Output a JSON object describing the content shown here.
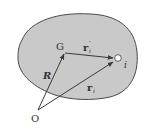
{
  "diagram": {
    "type": "rigid-body-position-vectors",
    "colors": {
      "body_fill": "#c9c9c9",
      "body_stroke": "#4a4a4a",
      "arrow": "#3a3a3a",
      "text": "#333333",
      "particle_fill": "#ffffff"
    },
    "labels": {
      "center_of_mass": "G",
      "origin": "O",
      "particle": "i",
      "R": "R",
      "r_prime_base": "r",
      "r_prime_sub": "i",
      "r_prime_sup": "′",
      "r_base": "r",
      "r_sub": "i"
    },
    "vectors": [
      {
        "name": "R",
        "from": "O",
        "to": "G"
      },
      {
        "name": "r_i",
        "from": "O",
        "to": "i"
      },
      {
        "name": "r_i'",
        "from": "G",
        "to": "i"
      }
    ]
  }
}
